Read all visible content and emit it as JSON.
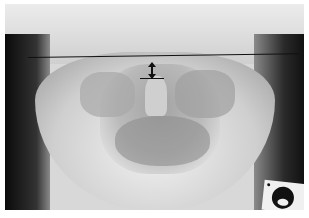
{
  "image": {
    "description": "Anteroposterior open-mouth radiograph of the upper cervical spine with a horizontal reference line and a double-headed measurement arrow",
    "annotations": {
      "reference_line": "horizontal line across skull base",
      "measurement_arrow": "double-headed vertical arrow between reference line and dens tip",
      "dens_tip_line": "short horizontal line at tip of dens"
    },
    "marker": "radiographic side marker (circular) at lower right",
    "colors": {
      "annotation": "#111111",
      "background": "#ffffff"
    }
  }
}
